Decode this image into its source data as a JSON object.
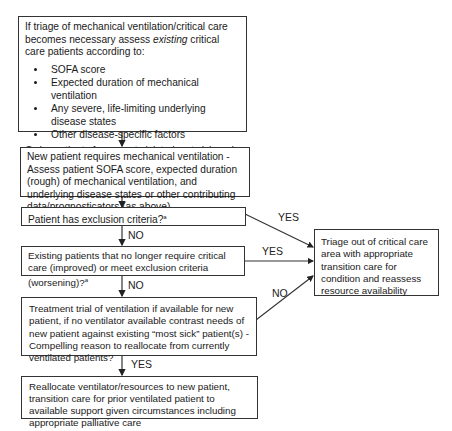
{
  "boxes": {
    "assess_existing": {
      "intro_pre": "If triage of mechanical ventilation/critical care becomes necessary assess ",
      "intro_em": "existing",
      "intro_post": " critical care patients according to:",
      "criteria": [
        "SOFA score",
        "Expected duration of mechanical ventilation",
        "Any severe, life-limiting underlying disease states",
        "Other disease-specific factors"
      ],
      "outro": "Order patients from most sick to least sick and reassess daily or as conditions warrant"
    },
    "new_patient": "New patient requires mechanical ventilation - Assess patient SOFA score, expected duration (rough) of mechanical ventilation, and underlying disease states or other contributing data/prognosticators (as above)",
    "exclusion": "Patient has exclusion criteria?",
    "exclusion_sup": "a",
    "existing_patients": "Existing patients that no longer require critical care (improved) or meet exclusion criteria (worsening)?",
    "existing_sup": "a",
    "treatment_trial": "Treatment trial of ventilation if available for new patient, if no ventilator available contrast needs of new patient against existing “most sick” patient(s) - Compelling reason to reallocate from currently ventilated patients?",
    "reallocate": "Reallocate ventilator/resources to new patient, transition care for prior ventilated patient to available support given circumstances including appropriate palliative care",
    "triage_out": "Triage out of critical care area with appropriate transition care for condition and reassess resource availability"
  },
  "labels": {
    "exclusion_yes": "YES",
    "exclusion_no": "NO",
    "existing_yes": "YES",
    "existing_no": "NO",
    "trial_no": "NO",
    "trial_yes": "YES"
  }
}
